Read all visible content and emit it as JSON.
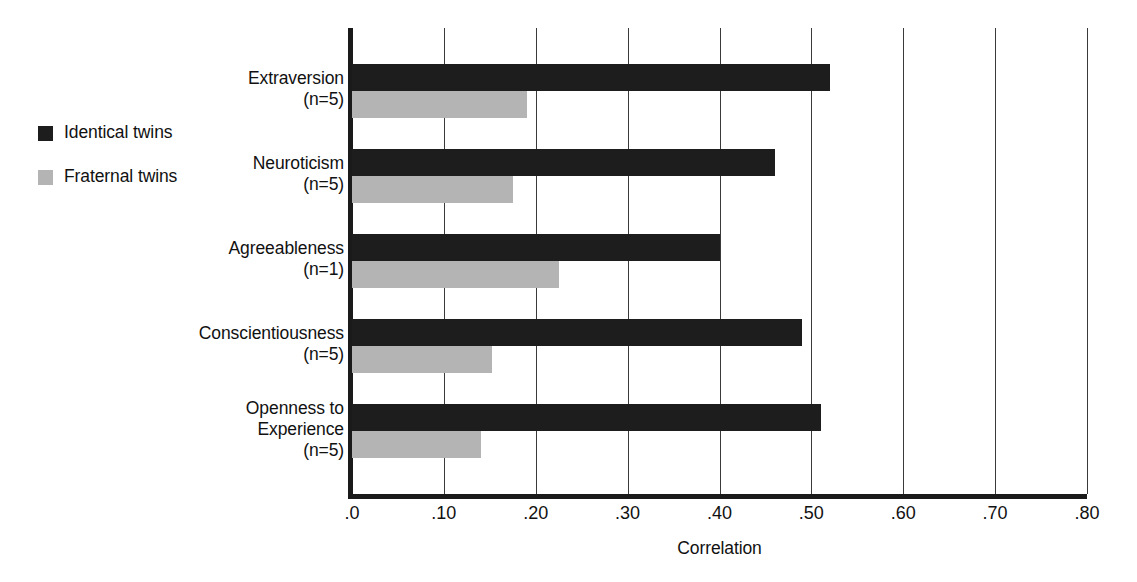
{
  "chart_data": {
    "type": "bar",
    "orientation": "horizontal",
    "title": "",
    "xlabel": "Correlation",
    "ylabel": "",
    "xlim": [
      0.0,
      0.8
    ],
    "xticks": [
      0.0,
      0.1,
      0.2,
      0.3,
      0.4,
      0.5,
      0.6,
      0.7,
      0.8
    ],
    "xtick_labels": [
      ".0",
      ".10",
      ".20",
      ".30",
      ".40",
      ".50",
      ".60",
      ".70",
      ".80"
    ],
    "grid": "vertical",
    "legend_position": "left-outside",
    "categories": [
      "Extraversion",
      "Neuroticism",
      "Agreeableness",
      "Conscientiousness",
      "Openness to Experience"
    ],
    "category_labels": [
      {
        "name": "Extraversion",
        "line1": "Extraversion",
        "line2": "",
        "n": "(n=5)"
      },
      {
        "name": "Neuroticism",
        "line1": "Neuroticism",
        "line2": "",
        "n": "(n=5)"
      },
      {
        "name": "Agreeableness",
        "line1": "Agreeableness",
        "line2": "",
        "n": "(n=1)"
      },
      {
        "name": "Conscientiousness",
        "line1": "Conscientiousness",
        "line2": "",
        "n": "(n=5)"
      },
      {
        "name": "Openness to Experience",
        "line1": "Openness to",
        "line2": "Experience",
        "n": "(n=5)"
      }
    ],
    "series": [
      {
        "name": "Identical twins",
        "color": "#1d1d1d",
        "values": [
          0.52,
          0.46,
          0.4,
          0.49,
          0.51
        ]
      },
      {
        "name": "Fraternal twins",
        "color": "#b4b4b4",
        "values": [
          0.19,
          0.175,
          0.225,
          0.152,
          0.14
        ]
      }
    ]
  },
  "legend": {
    "items": [
      {
        "label": "Identical twins",
        "color": "#1d1d1d"
      },
      {
        "label": "Fraternal twins",
        "color": "#b4b4b4"
      }
    ]
  }
}
